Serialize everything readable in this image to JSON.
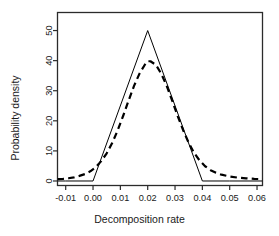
{
  "chart_data": {
    "type": "line",
    "title": "",
    "xlabel": "Decomposition rate",
    "ylabel": "Probability density",
    "xlim": [
      -0.013,
      0.062
    ],
    "ylim": [
      -1.5,
      56
    ],
    "xticks": [
      -0.01,
      0.0,
      0.01,
      0.02,
      0.03,
      0.04,
      0.05,
      0.06
    ],
    "xticklabels": [
      "-0.01",
      "0.00",
      "0.01",
      "0.02",
      "0.03",
      "0.04",
      "0.05",
      "0.06"
    ],
    "yticks": [
      0,
      10,
      20,
      30,
      40,
      50
    ],
    "yticklabels": [
      "0",
      "10",
      "20",
      "30",
      "40",
      "50"
    ],
    "grid": false,
    "legend": "none",
    "frame": true,
    "series": [
      {
        "name": "triangular-prior",
        "style": "solid",
        "color": "#000000",
        "linewidth": 1.0,
        "x": [
          -0.013,
          -0.01,
          0.0,
          0.02,
          0.04,
          0.05,
          0.062
        ],
        "y": [
          0,
          0,
          0,
          50,
          0,
          0,
          0
        ]
      },
      {
        "name": "posterior-density",
        "style": "dashed",
        "color": "#000000",
        "linewidth": 2.2,
        "x": [
          -0.013,
          -0.011,
          -0.009,
          -0.007,
          -0.005,
          -0.003,
          -0.001,
          0.001,
          0.003,
          0.005,
          0.007,
          0.009,
          0.011,
          0.013,
          0.015,
          0.017,
          0.019,
          0.02,
          0.021,
          0.023,
          0.025,
          0.027,
          0.029,
          0.031,
          0.033,
          0.035,
          0.037,
          0.039,
          0.041,
          0.043,
          0.045,
          0.047,
          0.05,
          0.053,
          0.056,
          0.059,
          0.062
        ],
        "y": [
          0.6,
          0.7,
          0.9,
          1.2,
          1.7,
          2.3,
          3.2,
          4.6,
          6.6,
          9.2,
          12.6,
          16.8,
          21.6,
          26.7,
          31.6,
          35.7,
          38.7,
          39.8,
          39.8,
          38.6,
          35.6,
          31.5,
          26.6,
          21.5,
          16.8,
          12.7,
          9.3,
          6.8,
          4.9,
          3.6,
          2.7,
          2.1,
          1.5,
          1.1,
          0.9,
          0.7,
          0.6
        ]
      }
    ]
  },
  "axes": {
    "x_tick_labels": [
      "-0.01",
      "0.00",
      "0.01",
      "0.02",
      "0.03",
      "0.04",
      "0.05",
      "0.06"
    ],
    "y_tick_labels": [
      "0",
      "10",
      "20",
      "30",
      "40",
      "50"
    ],
    "x_axis_title": "Decomposition rate",
    "y_axis_title": "Probability density"
  }
}
